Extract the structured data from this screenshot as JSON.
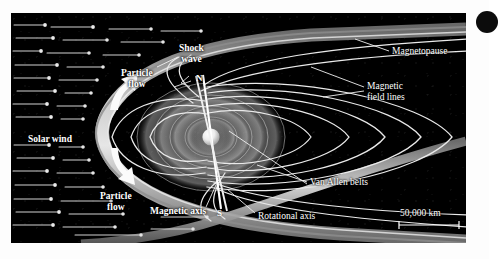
{
  "figure": {
    "background_color": "#000000",
    "page_color": "#ffffff"
  },
  "labels": {
    "solar_wind": "Solar wind",
    "particle_flow_upper": "Particle\nflow",
    "particle_flow_lower": "Particle\nflow",
    "shock_wave": "Shock\nwave",
    "magnetopause": "Magnetopause",
    "magnetic_field_lines": "Magnetic\nfield lines",
    "van_allen_belts": "Van Allen belts",
    "magnetic_axis": "Magnetic axis",
    "rotational_axis": "Rotational axis",
    "north_pole": "N",
    "south_pole": "S"
  },
  "scale_bar": {
    "label": "50,000 km",
    "length_px": 60
  },
  "colors": {
    "magnetopause_band": "#b9b9b9",
    "magnetopause_highlight": "#efefef",
    "field_line": "#e8e8e8",
    "earth": "#f2f2f2",
    "belt_shell": "#7a7a7a",
    "solar_wind_streak": "#d8d8d8",
    "label_text": "#ffffff"
  },
  "elements": {
    "earth_sphere": "earth-sphere",
    "van_allen_shells": 4,
    "solar_wind_streak_count": 34,
    "flow_arrows": 2
  }
}
